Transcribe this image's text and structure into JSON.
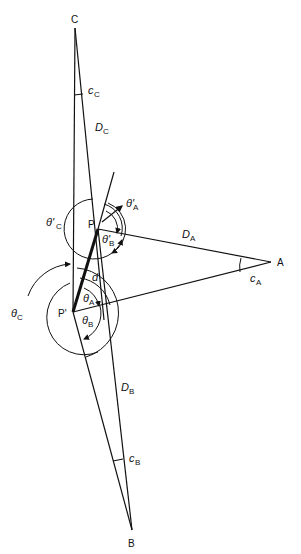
{
  "diagram": {
    "points": {
      "C": "C",
      "P": "P",
      "P_prime": "P'",
      "A": "A",
      "B": "B"
    },
    "distances": {
      "D_C": {
        "main": "D",
        "sub": "C"
      },
      "D_A": {
        "main": "D",
        "sub": "A"
      },
      "D_B": {
        "main": "D",
        "sub": "B"
      },
      "d": "d"
    },
    "small_angles": {
      "c_C": {
        "main": "c",
        "sub": "C"
      },
      "c_A": {
        "main": "c",
        "sub": "A"
      },
      "c_B": {
        "main": "c",
        "sub": "B"
      }
    },
    "angles_at_P": {
      "theta_prime_A": {
        "main": "θ'",
        "sub": "A"
      },
      "theta_prime_B": {
        "main": "θ'",
        "sub": "B"
      },
      "theta_prime_C": {
        "main": "θ'",
        "sub": "C"
      }
    },
    "angles_at_P_prime": {
      "theta_A": {
        "main": "θ",
        "sub": "A"
      },
      "theta_B": {
        "main": "θ",
        "sub": "B"
      },
      "theta_C": {
        "main": "θ",
        "sub": "C"
      }
    }
  }
}
